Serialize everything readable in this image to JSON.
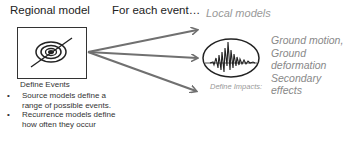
{
  "regional": {
    "title": "Regional model",
    "icon": "epicenter-target-icon",
    "caption": "Define Events",
    "bullets": [
      "Source models define a range of possible events.",
      "Recurrence models define how often they occur"
    ]
  },
  "flow": {
    "label": "For each event…",
    "arrow_color": "#707070",
    "arrows": 3
  },
  "local": {
    "title": "Local models",
    "icon": "seismogram-icon",
    "impacts_lines": [
      "Ground motion,",
      "Ground",
      "deformation",
      "Secondary",
      "effects"
    ],
    "caption": "Define Impacts:"
  }
}
